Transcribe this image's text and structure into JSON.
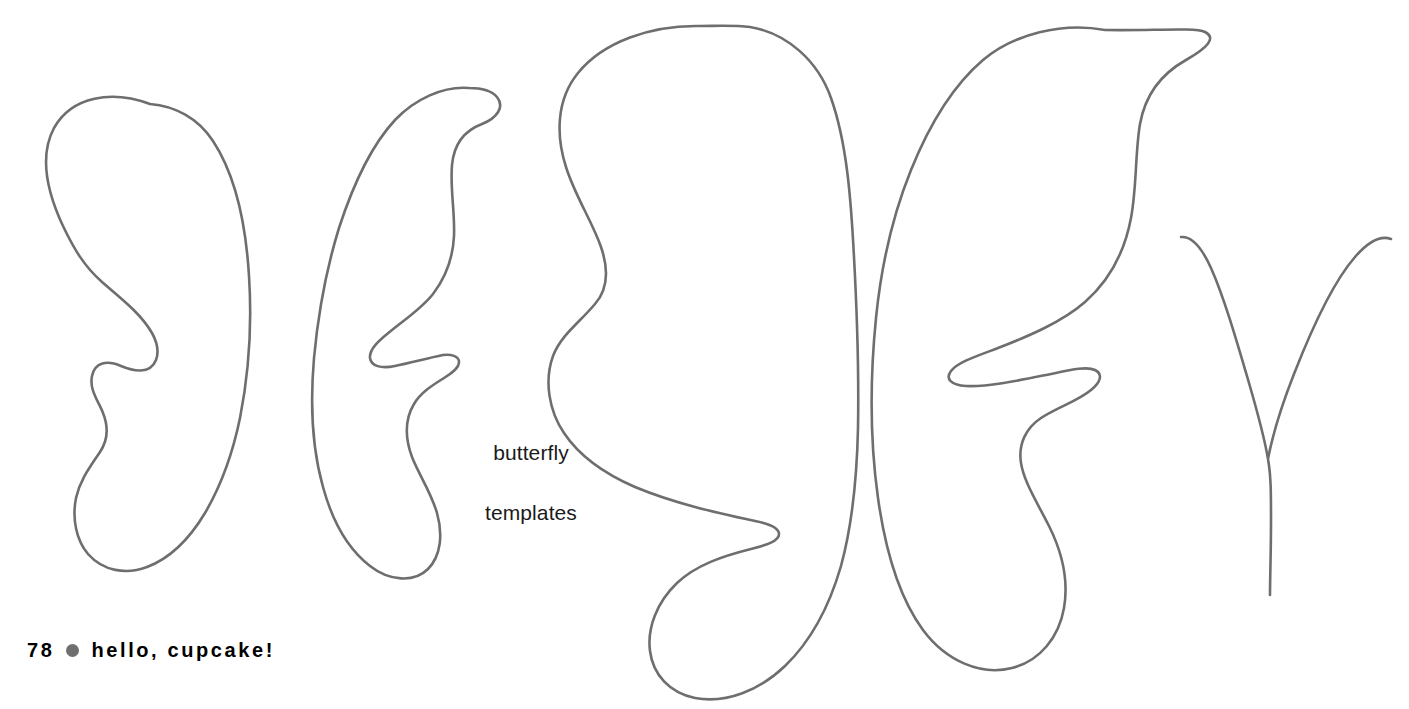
{
  "page": {
    "background_color": "#ffffff",
    "width": 1409,
    "height": 709,
    "top_cropped_text": ""
  },
  "caption": {
    "line1": "butterfly",
    "line2": "templates",
    "color": "#1a1a1a"
  },
  "footer": {
    "page_number": "78",
    "separator_icon": "bullet-dot-icon",
    "brand": "hello, cupcake!",
    "dot_color": "#6f6f6f",
    "text_color": "#000000"
  },
  "artwork": {
    "stroke_color": "#6e6e6e",
    "stroke_width": 2.6,
    "fill": "none",
    "shapes": [
      {
        "name": "small-butterfly-left-wing",
        "kind": "outline",
        "closed": true,
        "path": "M 150 104 C 112 90, 72 96, 54 128 C 38 158, 49 196, 63 226 C 74 249, 84 266, 102 282 C 123 300, 141 314, 152 333 C 157 342, 159 352, 156 360 C 150 375, 133 371, 121 366 C 107 360, 95 362, 92 376 C 89 390, 99 402, 103 413 C 109 428, 108 440, 100 452 C 90 467, 80 480, 76 498 C 72 518, 76 540, 88 554 C 103 571, 126 575, 147 567 C 171 558, 190 538, 205 513 C 222 484, 233 452, 240 418 C 249 372, 252 322, 249 276 C 246 226, 236 176, 213 141 C 198 118, 175 106, 150 104 Z"
      },
      {
        "name": "small-butterfly-right-wing",
        "kind": "outline",
        "closed": true,
        "path": "M 469 88 C 443 86, 415 99, 395 120 C 369 148, 352 188, 339 228 C 326 270, 318 315, 314 358 C 310 404, 312 448, 323 487 C 332 520, 348 549, 370 566 C 389 581, 414 583, 428 569 C 441 556, 443 534, 437 513 C 431 492, 419 475, 412 457 C 405 438, 405 419, 414 404 C 421 392, 433 385, 444 378 C 452 373, 459 368, 459 362 C 459 356, 451 354, 443 355 C 428 358, 410 363, 395 366 C 381 369, 371 366, 370 358 C 369 348, 381 339, 392 330 C 407 318, 422 308, 433 294 C 446 277, 453 257, 454 236 C 455 212, 450 188, 452 165 C 454 143, 466 130, 482 124 C 497 118, 505 107, 497 97 C 491 90, 480 88, 469 88 Z"
      },
      {
        "name": "large-butterfly-left-wing",
        "kind": "outline",
        "closed": true,
        "path": "M 700 26 C 651 25, 603 42, 578 73 C 556 100, 556 136, 566 167 C 575 196, 592 221, 601 247 C 609 270, 608 289, 595 304 C 580 322, 561 335, 553 356 C 544 381, 549 411, 564 433 C 580 457, 605 474, 635 487 C 676 504, 718 513, 755 521 C 770 524, 779 528, 779 534 C 779 541, 767 545, 751 549 C 723 556, 696 565, 677 583 C 657 602, 647 628, 650 651 C 653 675, 670 693, 695 698 C 726 704, 760 690, 785 666 C 812 640, 830 604, 841 566 C 853 522, 857 474, 858 428 C 859 370, 857 312, 854 257 C 851 200, 847 143, 831 98 C 818 61, 787 33, 750 27 C 734 25, 717 26, 700 26 Z"
      },
      {
        "name": "large-butterfly-right-wing",
        "kind": "outline",
        "closed": true,
        "path": "M 1105 30 C 1062 22, 1014 34, 983 60 C 950 88, 928 128, 911 170 C 892 217, 881 268, 876 318 C 870 378, 870 441, 878 498 C 885 548, 898 596, 923 630 C 946 661, 981 676, 1012 668 C 1040 661, 1059 637, 1064 608 C 1069 579, 1061 550, 1049 526 C 1037 502, 1024 482, 1021 463 C 1018 444, 1026 428, 1041 418 C 1058 407, 1078 401, 1091 390 C 1101 382, 1103 374, 1095 370 C 1087 366, 1070 370, 1051 374 C 1021 380, 989 387, 966 386 C 951 385, 945 379, 951 371 C 958 362, 977 356, 998 348 C 1029 336, 1062 322, 1085 302 C 1110 280, 1125 250, 1131 218 C 1137 186, 1135 153, 1140 124 C 1145 96, 1161 74, 1186 60 C 1207 48, 1217 38, 1205 32 C 1195 27, 1150 31, 1105 30 Z"
      },
      {
        "name": "antennae-template",
        "kind": "open-stroke",
        "closed": false,
        "path": "M 1181 237 C 1192 236, 1202 248, 1211 268 C 1224 297, 1237 342, 1249 383 C 1258 414, 1265 441, 1268 459 C 1271 476, 1271 492, 1271 520 C 1271 552, 1270 578, 1270 595 M 1268 459 C 1272 438, 1281 407, 1294 374 C 1312 328, 1334 281, 1355 257 C 1368 242, 1380 235, 1391 239"
      }
    ]
  }
}
